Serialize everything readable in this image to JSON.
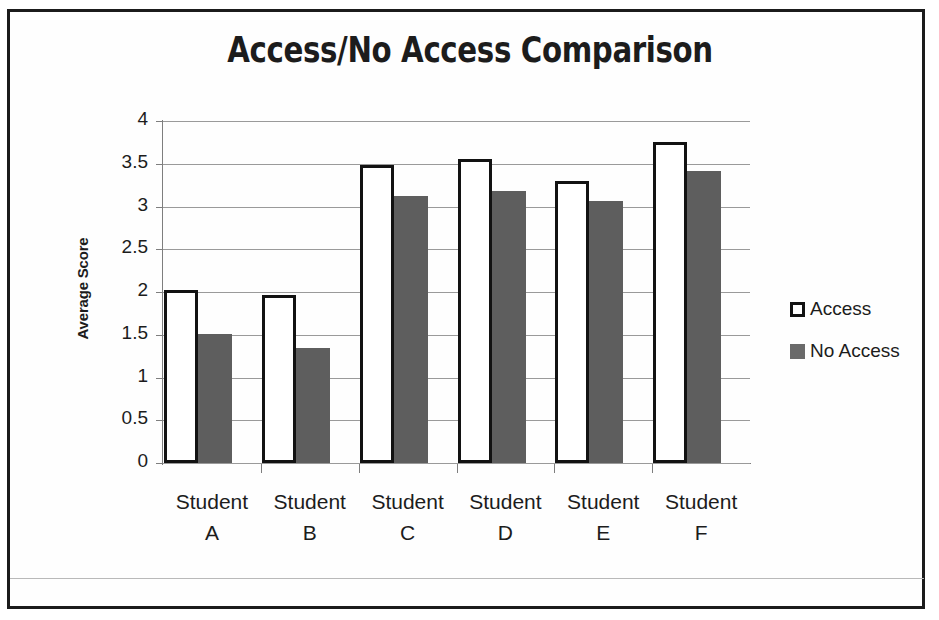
{
  "chart_data": {
    "type": "bar",
    "title": "Access/No Access Comparison",
    "xlabel": "",
    "ylabel": "Average Score",
    "categories": [
      "Student A",
      "Student B",
      "Student C",
      "Student D",
      "Student E",
      "Student F"
    ],
    "category_lines": [
      [
        "Student",
        "A"
      ],
      [
        "Student",
        "B"
      ],
      [
        "Student",
        "C"
      ],
      [
        "Student",
        "D"
      ],
      [
        "Student",
        "E"
      ],
      [
        "Student",
        "F"
      ]
    ],
    "series": [
      {
        "name": "Access",
        "values": [
          2.02,
          1.97,
          3.48,
          3.55,
          3.3,
          3.75
        ],
        "color": "#ffffff",
        "border_color": "#121212"
      },
      {
        "name": "No Access",
        "values": [
          1.51,
          1.34,
          3.12,
          3.18,
          3.06,
          3.41
        ],
        "color": "#5e5e5e",
        "border_color": "#5e5e5e"
      }
    ],
    "ylim": [
      0,
      4
    ],
    "ytick_labels": [
      "4",
      "3.5",
      "3",
      "2.5",
      "2",
      "1.5",
      "1",
      "0.5",
      "0"
    ],
    "ytick_values": [
      4,
      3.5,
      3,
      2.5,
      2,
      1.5,
      1,
      0.5,
      0
    ],
    "grid": true,
    "legend_position": "right",
    "legend": [
      {
        "label": "Access",
        "swatch": "outlined-square"
      },
      {
        "label": "No Access",
        "swatch": "filled-square"
      }
    ]
  },
  "colors": {
    "frame": "#1b1b1b",
    "gridline": "#9a9a9a",
    "axis": "#7e7e7e",
    "text": "#1c1c1c",
    "bar_access_fill": "#ffffff",
    "bar_access_outline": "#121212",
    "bar_noaccess_fill": "#5e5e5e",
    "background": "#ffffff"
  }
}
